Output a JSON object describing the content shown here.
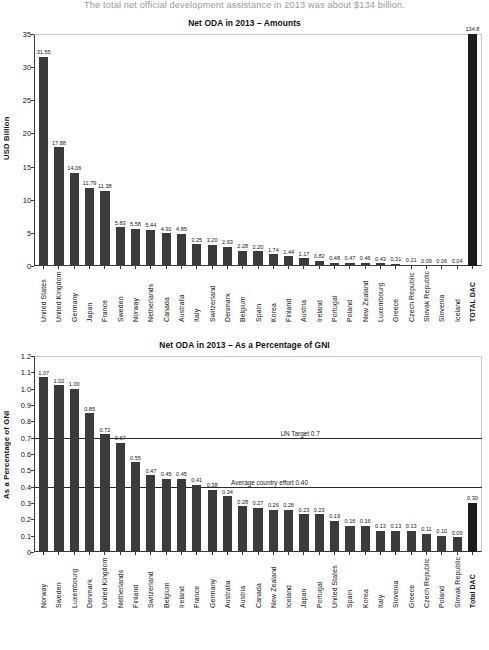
{
  "intro": {
    "text": "The total net official development assistance in 2013 was about $134 billion."
  },
  "chart_data": [
    {
      "type": "bar",
      "title": "Net ODA in 2013 – Amounts",
      "xlabel": "",
      "ylabel": "USD Billion",
      "ylim": [
        0,
        35
      ],
      "yticks": [
        0,
        5,
        10,
        15,
        20,
        25,
        30,
        35
      ],
      "grid": false,
      "legend": null,
      "categories": [
        "United States",
        "United Kingdom",
        "Germany",
        "Japan",
        "France",
        "Sweden",
        "Norway",
        "Netherlands",
        "Canada",
        "Australia",
        "Italy",
        "Switzerland",
        "Denmark",
        "Belgium",
        "Spain",
        "Korea",
        "Finland",
        "Austria",
        "Ireland",
        "Portugal",
        "Poland",
        "New Zealand",
        "Luxembourg",
        "Greece",
        "Czech Republic",
        "Slovak Republic",
        "Slovenia",
        "Iceland",
        "TOTAL DAC"
      ],
      "values": [
        31.55,
        17.88,
        14.06,
        11.79,
        11.38,
        5.83,
        5.58,
        5.44,
        4.91,
        4.85,
        3.25,
        3.2,
        2.93,
        2.28,
        2.2,
        1.74,
        1.44,
        1.17,
        0.82,
        0.48,
        0.47,
        0.46,
        0.43,
        0.31,
        0.21,
        0.09,
        0.06,
        0.04,
        134.8
      ],
      "value_labels": [
        "31.55",
        "17.88",
        "14.06",
        "11.79",
        "11.38",
        "5.83",
        "5.58",
        "5.44",
        "4.91",
        "4.85",
        "3.25",
        "3.20",
        "2.93",
        "2.28",
        "2.20",
        "1.74",
        "1.44",
        "1.17",
        "0.82",
        "0.48",
        "0.47",
        "0.46",
        "0.43",
        "0.31",
        "0.21",
        "0.09",
        "0.06",
        "0.04",
        "134.8"
      ]
    },
    {
      "type": "bar",
      "title": "Net ODA in 2013 – As a Percentage of GNI",
      "xlabel": "",
      "ylabel": "As a Percentage of GNI",
      "ylim": [
        0,
        1.2
      ],
      "yticks": [
        0,
        0.1,
        0.2,
        0.3,
        0.4,
        0.5,
        0.6,
        0.7,
        0.8,
        0.9,
        1.0,
        1.1,
        1.2
      ],
      "ytick_labels": [
        "0",
        "0.1",
        "0.2",
        "0.3",
        "0.4",
        "0.5",
        "0.6",
        "0.7",
        "0.8",
        "0.9",
        "1.0",
        "1.1",
        "1.2"
      ],
      "grid": false,
      "legend": null,
      "reference_lines": [
        {
          "value": 0.7,
          "label": "UN Target 0.7"
        },
        {
          "value": 0.4,
          "label": "Average country effort 0.40"
        }
      ],
      "categories": [
        "Norway",
        "Sweden",
        "Luxembourg",
        "Denmark",
        "United Kingdom",
        "Netherlands",
        "Finland",
        "Switzerland",
        "Belgium",
        "Ireland",
        "France",
        "Germany",
        "Australia",
        "Austria",
        "Canada",
        "New Zealand",
        "Iceland",
        "Japan",
        "Portugal",
        "United States",
        "Spain",
        "Korea",
        "Italy",
        "Slovenia",
        "Greece",
        "Czech Republic",
        "Poland",
        "Slovak Republic",
        "Total DAC"
      ],
      "values": [
        1.07,
        1.02,
        1.0,
        0.85,
        0.72,
        0.67,
        0.55,
        0.47,
        0.45,
        0.45,
        0.41,
        0.38,
        0.34,
        0.28,
        0.27,
        0.26,
        0.26,
        0.23,
        0.23,
        0.19,
        0.16,
        0.16,
        0.13,
        0.13,
        0.13,
        0.11,
        0.1,
        0.09,
        0.3
      ],
      "value_labels": [
        "1.07",
        "1.02",
        "1.00",
        "0.85",
        "0.72",
        "0.67",
        "0.55",
        "0.47",
        "0.45",
        "0.45",
        "0.41",
        "0.38",
        "0.34",
        "0.28",
        "0.27",
        "0.26",
        "0.26",
        "0.23",
        "0.23",
        "0.19",
        "0.16",
        "0.16",
        "0.13",
        "0.13",
        "0.13",
        "0.11",
        "0.10",
        "0.09",
        "0.30"
      ]
    }
  ],
  "colors": {
    "bar": "#3b3b3b",
    "bar_total": "#1c1c1c",
    "axis": "#3a3a3a",
    "frame": "#c9c9c9",
    "intro_text": "#9a9a9a"
  }
}
